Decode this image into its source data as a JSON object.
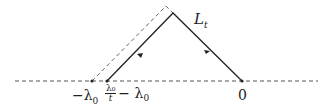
{
  "diagram": {
    "contour_label": "L",
    "contour_label_sub": "t",
    "labels": {
      "left_minus": "−λ",
      "left_minus_sub": "0",
      "frac_num": "λ₀",
      "frac_den": "t",
      "mid_rest": "− λ",
      "mid_rest_sub": "0",
      "origin": "0"
    },
    "colors": {
      "line": "#222222",
      "dashed": "#555555"
    }
  }
}
